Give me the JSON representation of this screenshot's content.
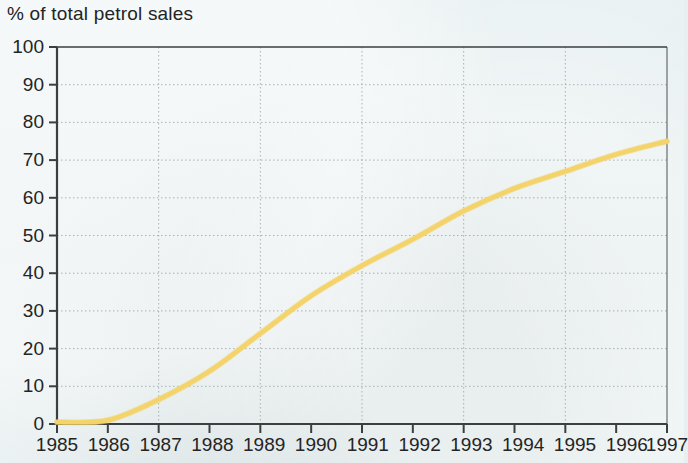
{
  "chart_data": {
    "type": "line",
    "title": "% of total petrol sales",
    "xlabel": "",
    "ylabel": "% of total petrol sales",
    "x": [
      1985,
      1986,
      1987,
      1988,
      1989,
      1990,
      1991,
      1992,
      1993,
      1994,
      1995,
      1996,
      1997
    ],
    "series": [
      {
        "name": "Unleaded petrol share",
        "color": "#f3d36a",
        "values": [
          0.5,
          1,
          6.5,
          14,
          24,
          34,
          42,
          49,
          56.5,
          62.5,
          67,
          71.5,
          75
        ]
      }
    ],
    "xtick_labels": [
      "1985",
      "1986",
      "1987",
      "1988",
      "1989",
      "1990",
      "1991",
      "1992",
      "1993",
      "1994",
      "1995",
      "1996",
      "1997"
    ],
    "ytick_labels": [
      "0",
      "10",
      "20",
      "30",
      "40",
      "50",
      "60",
      "70",
      "80",
      "90",
      "100"
    ],
    "ytick_values": [
      0,
      10,
      20,
      30,
      40,
      50,
      60,
      70,
      80,
      90,
      100
    ],
    "ylim": [
      0,
      100
    ],
    "xlim": [
      1985,
      1997
    ],
    "grid": "dotted-both-axes",
    "grid_x_every": 2,
    "legend": "none",
    "colors": {
      "background": "#e7eff0",
      "axis": "#3a3f40",
      "grid": "#9aa9ab",
      "line": "#f3d36a",
      "text": "#242424"
    }
  }
}
